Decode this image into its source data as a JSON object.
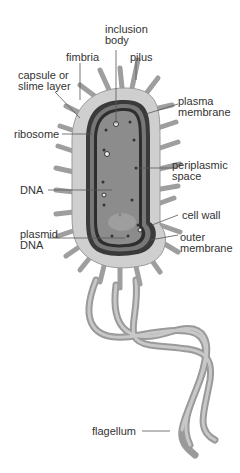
{
  "diagram": {
    "colors": {
      "capsule": "#c9c9c9",
      "cell_wall": "#3a3a3a",
      "cytoplasm": "#8a8a8a",
      "appendage": "#a8a8a8",
      "leader_line": "#555555",
      "label_text": "#333333"
    },
    "labels": [
      {
        "id": "inclusion-body",
        "line1": "inclusion",
        "line2": "body"
      },
      {
        "id": "fimbria",
        "line1": "fimbria",
        "line2": ""
      },
      {
        "id": "pilus",
        "line1": "pilus",
        "line2": ""
      },
      {
        "id": "capsule",
        "line1": "capsule or",
        "line2": "slime layer"
      },
      {
        "id": "plasma-membrane",
        "line1": "plasma",
        "line2": "membrane"
      },
      {
        "id": "ribosome",
        "line1": "ribosome",
        "line2": ""
      },
      {
        "id": "periplasmic-space",
        "line1": "periplasmic",
        "line2": "space"
      },
      {
        "id": "dna",
        "line1": "DNA",
        "line2": ""
      },
      {
        "id": "cell-wall",
        "line1": "cell wall",
        "line2": ""
      },
      {
        "id": "plasmid-dna",
        "line1": "plasmid",
        "line2": "DNA"
      },
      {
        "id": "outer-membrane",
        "line1": "outer",
        "line2": "membrane"
      },
      {
        "id": "flagellum",
        "line1": "flagellum",
        "line2": ""
      }
    ]
  }
}
